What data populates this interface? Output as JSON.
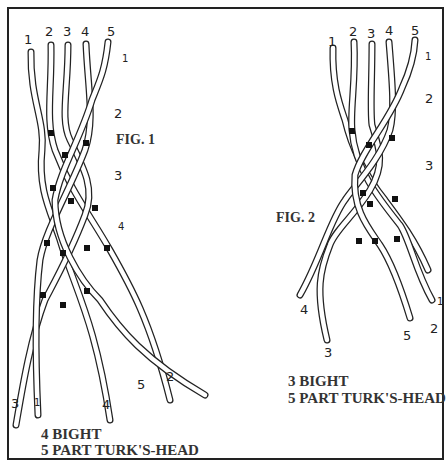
{
  "figures": [
    {
      "id": "fig1",
      "title": "FIG. 1",
      "strand_labels_top": [
        "1",
        "2",
        "3",
        "4",
        "5"
      ],
      "row_labels": [
        "1",
        "2",
        "3",
        "4"
      ],
      "strand_labels_bottom": [
        "3",
        "1",
        "4",
        "5",
        "2"
      ],
      "caption_line1": "4 BIGHT",
      "caption_line2": "5 PART TURK'S-HEAD"
    },
    {
      "id": "fig2",
      "title": "FIG. 2",
      "strand_labels_top": [
        "1",
        "2",
        "3",
        "4",
        "5"
      ],
      "row_labels": [
        "1",
        "2",
        "3"
      ],
      "strand_labels_bottom": [
        "4",
        "3",
        "5",
        "2",
        "1"
      ],
      "caption_line1": "3 BIGHT",
      "caption_line2": "5 PART TURK'S-HEAD"
    }
  ],
  "colors": {
    "ink": "#222222",
    "paper": "#ffffff"
  }
}
